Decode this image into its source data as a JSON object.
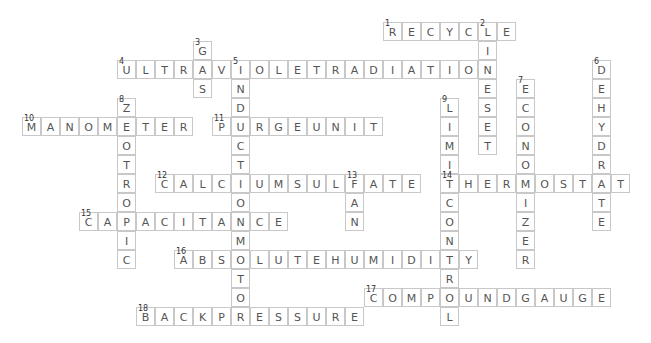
{
  "crossword": {
    "cell_size": 19,
    "origin_x": 22,
    "origin_y": 22,
    "words": [
      {
        "number": 1,
        "answer": "RECYCLE",
        "direction": "across",
        "row": 0,
        "col": 19
      },
      {
        "number": 2,
        "answer": "LINESET",
        "direction": "down",
        "row": 0,
        "col": 24
      },
      {
        "number": 3,
        "answer": "GAS",
        "direction": "down",
        "row": 1,
        "col": 9
      },
      {
        "number": 4,
        "answer": "ULTRAVIOLETRADIATION",
        "direction": "across",
        "row": 2,
        "col": 5
      },
      {
        "number": 5,
        "answer": "INDUCTIONMOTOR",
        "direction": "down",
        "row": 2,
        "col": 11
      },
      {
        "number": 6,
        "answer": "DEHYDRATE",
        "direction": "down",
        "row": 2,
        "col": 30
      },
      {
        "number": 7,
        "answer": "ECONOMIZER",
        "direction": "down",
        "row": 3,
        "col": 26
      },
      {
        "number": 8,
        "answer": "ZEOTROPIC",
        "direction": "down",
        "row": 4,
        "col": 5
      },
      {
        "number": 9,
        "answer": "LIMITCONTROL",
        "direction": "down",
        "row": 4,
        "col": 22
      },
      {
        "number": 10,
        "answer": "MANOMETER",
        "direction": "across",
        "row": 5,
        "col": 0
      },
      {
        "number": 11,
        "answer": "PURGEUNIT",
        "direction": "across",
        "row": 5,
        "col": 10
      },
      {
        "number": 12,
        "answer": "CALCIUMSULFATE",
        "direction": "across",
        "row": 8,
        "col": 7
      },
      {
        "number": 13,
        "answer": "FAN",
        "direction": "down",
        "row": 8,
        "col": 17
      },
      {
        "number": 14,
        "answer": "THERMOSTAT",
        "direction": "across",
        "row": 8,
        "col": 22
      },
      {
        "number": 15,
        "answer": "CAPACITANCE",
        "direction": "across",
        "row": 10,
        "col": 3
      },
      {
        "number": 16,
        "answer": "ABSOLUTEHUMIDITY",
        "direction": "across",
        "row": 12,
        "col": 8
      },
      {
        "number": 17,
        "answer": "COMPOUNDGAUGE",
        "direction": "across",
        "row": 14,
        "col": 18
      },
      {
        "number": 18,
        "answer": "BACKPRESSURE",
        "direction": "across",
        "row": 15,
        "col": 6
      }
    ]
  }
}
